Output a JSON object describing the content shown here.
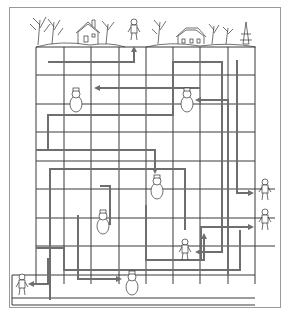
{
  "puzzle": {
    "type": "maze",
    "theme": "winter village",
    "scene_top": [
      "trees",
      "snowy house",
      "child",
      "snowy house with trees",
      "pine tree"
    ],
    "grid": {
      "x_lines": [
        36,
        64,
        91,
        119,
        146,
        173,
        200,
        228,
        255
      ],
      "y_lines": [
        47,
        75,
        104,
        132,
        161,
        189,
        218,
        246,
        275,
        298
      ],
      "line_color": "#3a3a3a"
    },
    "path_color": "#6e6e6e",
    "characters": [
      {
        "name": "child-top",
        "x": 134,
        "y": 30,
        "kind": "kid"
      },
      {
        "name": "snowman-1",
        "x": 76,
        "y": 100,
        "kind": "snowman"
      },
      {
        "name": "snowman-2",
        "x": 187,
        "y": 100,
        "kind": "snowman"
      },
      {
        "name": "snowman-3",
        "x": 157,
        "y": 187,
        "kind": "snowman"
      },
      {
        "name": "snowman-4",
        "x": 103,
        "y": 222,
        "kind": "snowman"
      },
      {
        "name": "snowman-5",
        "x": 132,
        "y": 283,
        "kind": "snowman"
      },
      {
        "name": "kid-skier-1",
        "x": 265,
        "y": 190,
        "kind": "kid"
      },
      {
        "name": "kid-skier-2",
        "x": 265,
        "y": 220,
        "kind": "kid"
      },
      {
        "name": "kid-3",
        "x": 185,
        "y": 250,
        "kind": "kid"
      },
      {
        "name": "kid-4",
        "x": 22,
        "y": 285,
        "kind": "kid"
      }
    ],
    "paths": [
      {
        "points": [
          [
            48,
            62
          ],
          [
            48,
            62
          ],
          [
            134,
            62
          ],
          [
            134,
            48
          ]
        ],
        "arrow": "up"
      },
      {
        "points": [
          [
            200,
            88
          ],
          [
            96,
            88
          ]
        ],
        "arrow": "left"
      },
      {
        "points": [
          [
            228,
            275
          ],
          [
            228,
            100
          ],
          [
            216,
            100
          ],
          [
            197,
            100
          ]
        ],
        "arrow": "left-to-snowman-2"
      },
      {
        "points": [
          [
            48,
            150
          ],
          [
            48,
            115
          ],
          [
            173,
            115
          ],
          [
            173,
            75
          ],
          [
            173,
            62
          ],
          [
            222,
            62
          ],
          [
            222,
            160
          ],
          [
            222,
            180
          ]
        ],
        "arrow": "none"
      },
      {
        "points": [
          [
            36,
            150
          ],
          [
            155,
            150
          ],
          [
            155,
            172
          ]
        ],
        "arrow": "down"
      },
      {
        "points": [
          [
            205,
            60
          ],
          [
            205,
            60
          ]
        ],
        "arrow": "none"
      },
      {
        "points": [
          [
            146,
            158
          ],
          [
            146,
            158
          ]
        ],
        "arrow": "none"
      },
      {
        "points": [
          [
            50,
            300
          ],
          [
            50,
            169
          ],
          [
            185,
            169
          ],
          [
            185,
            230
          ],
          [
            185,
            230
          ]
        ],
        "arrow": "none"
      },
      {
        "points": [
          [
            237,
            60
          ],
          [
            237,
            193
          ],
          [
            252,
            193
          ]
        ],
        "arrow": "right"
      },
      {
        "points": [
          [
            78,
            215
          ],
          [
            78,
            279
          ],
          [
            120,
            279
          ]
        ],
        "arrow": "right"
      },
      {
        "points": [
          [
            48,
            258
          ],
          [
            48,
            284
          ],
          [
            30,
            284
          ]
        ],
        "arrow": "left"
      },
      {
        "points": [
          [
            201,
            260
          ],
          [
            201,
            227
          ],
          [
            252,
            227
          ]
        ],
        "arrow": "right"
      },
      {
        "points": [
          [
            222,
            180
          ],
          [
            222,
            252
          ],
          [
            197,
            252
          ]
        ],
        "arrow": "left"
      },
      {
        "points": [
          [
            36,
            248
          ],
          [
            64,
            248
          ],
          [
            64,
            270
          ],
          [
            160,
            270
          ],
          [
            160,
            270
          ],
          [
            240,
            270
          ],
          [
            240,
            230
          ]
        ],
        "arrow": "none"
      },
      {
        "points": [
          [
            100,
            186
          ],
          [
            110,
            186
          ],
          [
            110,
            200
          ],
          [
            110,
            225
          ]
        ],
        "arrow": "none"
      },
      {
        "points": [
          [
            146,
            205
          ],
          [
            146,
            260
          ],
          [
            204,
            260
          ],
          [
            204,
            235
          ]
        ],
        "arrow": "up"
      }
    ]
  }
}
